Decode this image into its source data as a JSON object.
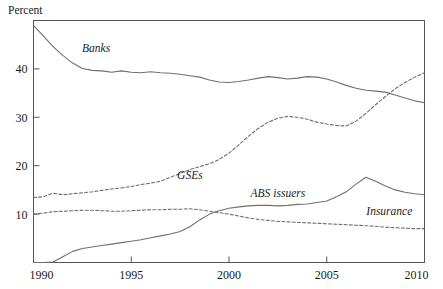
{
  "chart_data": {
    "type": "line",
    "title": "",
    "xlabel": "",
    "ylabel": "Percent",
    "xlim": [
      1990,
      2010
    ],
    "ylim": [
      0,
      50
    ],
    "xticks": [
      1990,
      1995,
      2000,
      2005,
      2010
    ],
    "xtick_labels": [
      "1990",
      "1995",
      "2000",
      "2005",
      "2010"
    ],
    "yticks": [
      10,
      20,
      30,
      40
    ],
    "ytick_labels": [
      "10",
      "20",
      "30",
      "40"
    ],
    "grid": false,
    "legend_position": "inline-annotations",
    "x": [
      1990,
      1990.5,
      1991,
      1991.5,
      1992,
      1992.5,
      1993,
      1993.5,
      1994,
      1994.5,
      1995,
      1995.5,
      1996,
      1996.5,
      1997,
      1997.5,
      1998,
      1998.5,
      1999,
      1999.5,
      2000,
      2000.5,
      2001,
      2001.5,
      2002,
      2002.5,
      2003,
      2003.5,
      2004,
      2004.5,
      2005,
      2005.5,
      2006,
      2006.5,
      2007,
      2007.5,
      2008,
      2008.5,
      2009,
      2009.5,
      2010
    ],
    "series": [
      {
        "name": "Banks",
        "style": "solid",
        "label_x": 1993.2,
        "label_y": 43.5,
        "values": [
          49.0,
          46.8,
          44.6,
          42.8,
          41.2,
          40.1,
          39.7,
          39.6,
          39.3,
          39.6,
          39.3,
          39.2,
          39.4,
          39.2,
          39.1,
          38.9,
          38.6,
          38.3,
          37.7,
          37.3,
          37.2,
          37.4,
          37.7,
          38.1,
          38.4,
          38.2,
          37.9,
          38.1,
          38.4,
          38.3,
          37.9,
          37.3,
          36.6,
          36.0,
          35.6,
          35.4,
          35.2,
          34.6,
          34.0,
          33.4,
          33.0
        ]
      },
      {
        "name": "GSEs",
        "style": "dashed",
        "label_x": 1998.0,
        "label_y": 17.3,
        "values": [
          13.4,
          13.6,
          14.3,
          14.0,
          14.2,
          14.4,
          14.6,
          14.9,
          15.2,
          15.4,
          15.7,
          16.1,
          16.4,
          16.8,
          17.6,
          18.4,
          19.2,
          19.8,
          20.4,
          21.3,
          22.6,
          24.3,
          26.1,
          27.7,
          29.0,
          29.8,
          30.2,
          30.0,
          29.6,
          29.0,
          28.6,
          28.3,
          28.2,
          29.2,
          30.8,
          32.6,
          34.3,
          35.9,
          37.2,
          38.3,
          39.2
        ]
      },
      {
        "name": "ABS issuers",
        "style": "solid",
        "label_x": 2002.5,
        "label_y": 13.6,
        "values": [
          0.0,
          0.0,
          0.1,
          1.2,
          2.3,
          2.9,
          3.2,
          3.5,
          3.8,
          4.1,
          4.4,
          4.7,
          5.1,
          5.5,
          5.9,
          6.4,
          7.4,
          8.8,
          10.0,
          10.7,
          11.2,
          11.5,
          11.7,
          11.8,
          11.8,
          11.7,
          11.8,
          12.0,
          12.1,
          12.4,
          12.7,
          13.6,
          14.6,
          16.2,
          17.6,
          16.8,
          15.8,
          15.0,
          14.5,
          14.2,
          14.0
        ]
      },
      {
        "name": "Insurance",
        "style": "dashed",
        "label_x": 2008.2,
        "label_y": 9.8,
        "values": [
          10.0,
          10.2,
          10.5,
          10.6,
          10.7,
          10.8,
          10.8,
          10.7,
          10.6,
          10.6,
          10.7,
          10.8,
          10.9,
          10.9,
          11.0,
          11.0,
          11.1,
          10.9,
          10.6,
          10.3,
          10.0,
          9.6,
          9.2,
          8.9,
          8.7,
          8.5,
          8.4,
          8.3,
          8.2,
          8.1,
          8.0,
          7.9,
          7.8,
          7.7,
          7.6,
          7.5,
          7.3,
          7.2,
          7.1,
          7.0,
          7.0
        ]
      }
    ],
    "colors": {
      "line": "#6f6f6f",
      "axis": "#555555",
      "text": "#1a1a1a",
      "background": "#ffffff"
    }
  }
}
